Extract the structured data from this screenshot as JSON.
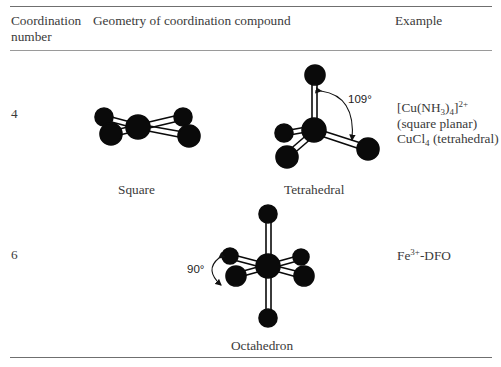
{
  "table": {
    "headers": {
      "coordination_number_line1": "Coordination",
      "coordination_number_line2": "number",
      "geometry": "Geometry of coordination compound",
      "example": "Example"
    },
    "rows": [
      {
        "coordination_number": "4",
        "geometries": [
          {
            "label": "Square"
          },
          {
            "label": "Tetrahedral",
            "angle": "109°"
          }
        ],
        "example": {
          "line1_base": "[Cu(NH",
          "line1_sub": "3",
          "line1_mid": ")]",
          "line1_sub2": "4",
          "line1_sup": "2+",
          "line2": "(square planar)",
          "line3_base": "CuCl",
          "line3_sub": "4",
          "line3_rest": " (tetrahedral)"
        }
      },
      {
        "coordination_number": "6",
        "geometries": [
          {
            "label": "Octahedron",
            "angle": "90°"
          }
        ],
        "example": {
          "base": "Fe",
          "sup": "3+",
          "rest": "-DFO"
        }
      }
    ]
  },
  "colors": {
    "atom": "#0a0a0a",
    "rule": "#6f6f6f",
    "text": "#3a3a3a"
  }
}
